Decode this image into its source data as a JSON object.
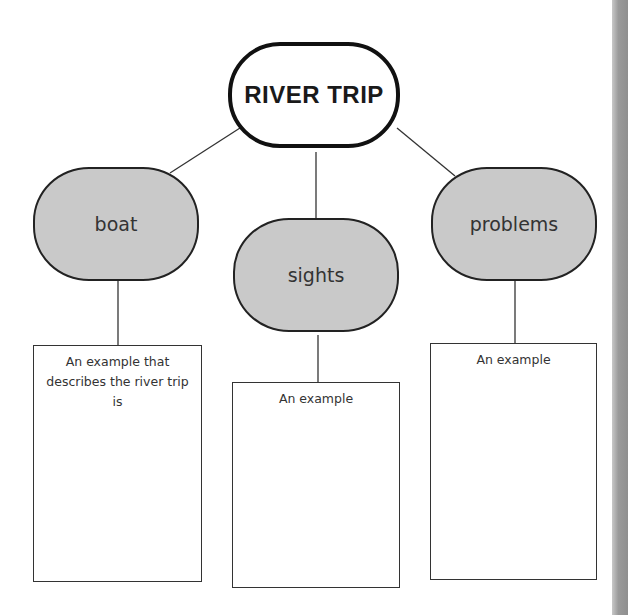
{
  "diagram": {
    "title": "RIVER TRIP",
    "nodes": [
      {
        "label": "boat",
        "box_text": "An example that describes the river trip is"
      },
      {
        "label": "sights",
        "box_text": "An example"
      },
      {
        "label": "problems",
        "box_text": "An example"
      }
    ],
    "colors": {
      "node_fill": "#c9c9c9",
      "main_fill": "#ffffff",
      "stroke": "#111111"
    }
  }
}
